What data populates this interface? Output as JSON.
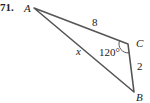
{
  "problem": {
    "number": "71."
  },
  "triangle": {
    "vertices": {
      "A": "A",
      "B": "B",
      "C": "C"
    },
    "sides": {
      "AC": "8",
      "CB": "2",
      "AB": "x"
    },
    "angle_C": "120°",
    "colors": {
      "stroke": "#555555",
      "text": "#222222"
    }
  }
}
